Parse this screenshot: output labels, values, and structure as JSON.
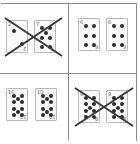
{
  "puzzle": {
    "cells": [
      {
        "cards": [
          {
            "rank": "2",
            "suit": "clubs"
          },
          {
            "rank": "7",
            "suit": "clubs"
          }
        ],
        "crossed_out": true
      },
      {
        "cards": [
          {
            "rank": "6",
            "suit": "spades"
          },
          {
            "rank": "6",
            "suit": "spades"
          }
        ],
        "crossed_out": false
      },
      {
        "cards": [
          {
            "rank": "10",
            "suit": "clubs"
          },
          {
            "rank": "10",
            "suit": "clubs"
          }
        ],
        "crossed_out": false
      },
      {
        "cards": [
          {
            "rank": "9",
            "suit": "hearts"
          },
          {
            "rank": "9",
            "suit": "hearts"
          }
        ],
        "crossed_out": true
      }
    ]
  },
  "colors": {
    "grid": "#8a8a8a",
    "pip": "#2c2c2c",
    "cross": "#3a3a3a"
  }
}
